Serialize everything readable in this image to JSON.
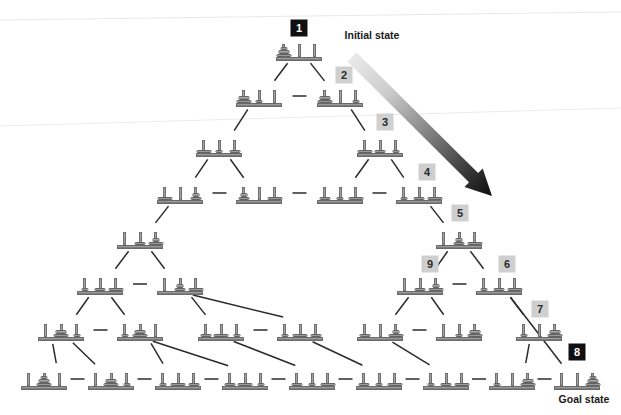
{
  "figure": {
    "type": "state-space-diagram"
  },
  "colors": {
    "tag_light_bg": "#cfcfcf",
    "tag_light_text": "#2a2a2a",
    "tag_dark_bg": "#101010",
    "tag_dark_text": "#ffffff",
    "disc": "#9a9a9a",
    "peg": "#8e8e8e",
    "base": "#8f8f8f",
    "edge": "#2b2b2b",
    "arrow_start": "#e2e2e2",
    "arrow_end": "#111111"
  },
  "captions": [
    {
      "id": "initial-state",
      "text": "Initial state",
      "x": 372,
      "y": 35
    },
    {
      "id": "goal-state",
      "text": "Goal state",
      "x": 584,
      "y": 399
    }
  ],
  "tags": [
    {
      "id": "1",
      "text": "1",
      "style": "dark",
      "x": 299,
      "y": 28
    },
    {
      "id": "2",
      "text": "2",
      "style": "light",
      "x": 344,
      "y": 75
    },
    {
      "id": "3",
      "text": "3",
      "style": "light",
      "x": 385,
      "y": 122
    },
    {
      "id": "4",
      "text": "4",
      "style": "light",
      "x": 427,
      "y": 172
    },
    {
      "id": "5",
      "text": "5",
      "style": "light",
      "x": 460,
      "y": 213
    },
    {
      "id": "9",
      "text": "9",
      "style": "light",
      "x": 430,
      "y": 264
    },
    {
      "id": "6",
      "text": "6",
      "style": "light",
      "x": 507,
      "y": 264
    },
    {
      "id": "7",
      "text": "7",
      "style": "light",
      "x": 540,
      "y": 309
    },
    {
      "id": "8",
      "text": "8",
      "style": "dark",
      "x": 577,
      "y": 352
    }
  ],
  "layout": {
    "rows_y": [
      50,
      96,
      146,
      193,
      238,
      284,
      330,
      379
    ],
    "node_width": 46,
    "node_height": 22,
    "peg_count": 3,
    "disc_count": 3
  },
  "nodes": [
    {
      "id": "n1",
      "row": 0,
      "x": 299,
      "y": 50,
      "pegs": [
        [
          3,
          2,
          1
        ],
        [],
        []
      ]
    },
    {
      "id": "n2",
      "row": 1,
      "x": 259,
      "y": 96,
      "pegs": [
        [
          3,
          2
        ],
        [
          1
        ],
        []
      ]
    },
    {
      "id": "n3",
      "row": 1,
      "x": 340,
      "y": 96,
      "pegs": [
        [
          3,
          2
        ],
        [],
        [
          1
        ]
      ]
    },
    {
      "id": "n4",
      "row": 2,
      "x": 219,
      "y": 146,
      "pegs": [
        [
          3
        ],
        [
          1
        ],
        [
          2
        ]
      ]
    },
    {
      "id": "n5",
      "row": 2,
      "x": 380,
      "y": 146,
      "pegs": [
        [
          3
        ],
        [
          2
        ],
        [
          1
        ]
      ]
    },
    {
      "id": "n6",
      "row": 3,
      "x": 180,
      "y": 193,
      "pegs": [
        [
          3
        ],
        [],
        [
          2,
          1
        ]
      ]
    },
    {
      "id": "n7",
      "row": 3,
      "x": 259,
      "y": 193,
      "pegs": [
        [
          2,
          1
        ],
        [],
        [
          3
        ]
      ]
    },
    {
      "id": "n8",
      "row": 3,
      "x": 340,
      "y": 193,
      "pegs": [
        [
          2
        ],
        [
          1
        ],
        [
          3
        ]
      ]
    },
    {
      "id": "n9",
      "row": 3,
      "x": 419,
      "y": 193,
      "pegs": [
        [
          1
        ],
        [
          2
        ],
        [
          3
        ]
      ]
    },
    {
      "id": "n10",
      "row": 4,
      "x": 140,
      "y": 238,
      "pegs": [
        [],
        [
          2
        ],
        [
          3,
          1
        ]
      ]
    },
    {
      "id": "n11",
      "row": 4,
      "x": 459,
      "y": 238,
      "pegs": [
        [],
        [
          2,
          1
        ],
        [
          3
        ]
      ]
    },
    {
      "id": "n12",
      "row": 5,
      "x": 100,
      "y": 284,
      "pegs": [
        [
          1
        ],
        [
          2
        ],
        [
          3
        ]
      ]
    },
    {
      "id": "n13",
      "row": 5,
      "x": 180,
      "y": 284,
      "pegs": [
        [],
        [
          2,
          1
        ],
        [
          3
        ]
      ]
    },
    {
      "id": "n14",
      "row": 5,
      "x": 420,
      "y": 284,
      "pegs": [
        [],
        [
          2
        ],
        [
          3,
          1
        ]
      ]
    },
    {
      "id": "n15",
      "row": 5,
      "x": 499,
      "y": 284,
      "pegs": [
        [
          1
        ],
        [
          2
        ],
        [
          3
        ]
      ]
    },
    {
      "id": "n16",
      "row": 6,
      "x": 61,
      "y": 330,
      "pegs": [
        [],
        [
          3,
          2
        ],
        [
          1
        ]
      ]
    },
    {
      "id": "n17",
      "row": 6,
      "x": 140,
      "y": 330,
      "pegs": [
        [
          1
        ],
        [
          3,
          2
        ],
        []
      ]
    },
    {
      "id": "n18",
      "row": 6,
      "x": 221,
      "y": 330,
      "pegs": [
        [
          2
        ],
        [
          3
        ],
        [
          1
        ]
      ]
    },
    {
      "id": "n19",
      "row": 6,
      "x": 300,
      "y": 330,
      "pegs": [
        [
          1
        ],
        [
          3
        ],
        [
          2
        ]
      ]
    },
    {
      "id": "n20",
      "row": 6,
      "x": 380,
      "y": 330,
      "pegs": [
        [
          2
        ],
        [],
        [
          3,
          1
        ]
      ]
    },
    {
      "id": "n21",
      "row": 6,
      "x": 459,
      "y": 330,
      "pegs": [
        [],
        [
          1
        ],
        [
          3,
          2
        ]
      ]
    },
    {
      "id": "n22",
      "row": 6,
      "x": 539,
      "y": 330,
      "pegs": [
        [
          1
        ],
        [],
        [
          3,
          2
        ]
      ]
    },
    {
      "id": "n23",
      "row": 7,
      "x": 44,
      "y": 379,
      "pegs": [
        [],
        [
          3,
          2,
          1
        ],
        []
      ]
    },
    {
      "id": "n24",
      "row": 7,
      "x": 111,
      "y": 379,
      "pegs": [
        [],
        [
          3,
          2
        ],
        [
          1
        ]
      ]
    },
    {
      "id": "n25",
      "row": 7,
      "x": 178,
      "y": 379,
      "pegs": [
        [
          1
        ],
        [
          3
        ],
        [
          2
        ]
      ]
    },
    {
      "id": "n26",
      "row": 7,
      "x": 245,
      "y": 379,
      "pegs": [
        [
          2
        ],
        [
          3
        ],
        [
          1
        ]
      ]
    },
    {
      "id": "n27",
      "row": 7,
      "x": 312,
      "y": 379,
      "pegs": [
        [
          2
        ],
        [
          1
        ],
        [
          3
        ]
      ]
    },
    {
      "id": "n28",
      "row": 7,
      "x": 379,
      "y": 379,
      "pegs": [
        [
          2
        ],
        [
          1
        ],
        [
          3
        ]
      ]
    },
    {
      "id": "n29",
      "row": 7,
      "x": 446,
      "y": 379,
      "pegs": [
        [
          1
        ],
        [
          2
        ],
        [
          3
        ]
      ]
    },
    {
      "id": "n30",
      "row": 7,
      "x": 577,
      "y": 379,
      "pegs": [
        [],
        [],
        [
          3,
          2,
          1
        ]
      ]
    },
    {
      "id": "n31",
      "row": 7,
      "x": 512,
      "y": 379,
      "pegs": [
        [
          1
        ],
        [],
        [
          3,
          2
        ]
      ]
    }
  ],
  "edges_diagonal": [
    [
      "n1",
      "n2"
    ],
    [
      "n1",
      "n3"
    ],
    [
      "n2",
      "n4"
    ],
    [
      "n3",
      "n5"
    ],
    [
      "n4",
      "n6"
    ],
    [
      "n4",
      "n7"
    ],
    [
      "n5",
      "n8"
    ],
    [
      "n5",
      "n9"
    ],
    [
      "n6",
      "n10"
    ],
    [
      "n9",
      "n11"
    ],
    [
      "n10",
      "n12"
    ],
    [
      "n10",
      "n13"
    ],
    [
      "n11",
      "n14"
    ],
    [
      "n11",
      "n15"
    ],
    [
      "n12",
      "n16"
    ],
    [
      "n12",
      "n17"
    ],
    [
      "n13",
      "n18"
    ],
    [
      "n13",
      "n19"
    ],
    [
      "n14",
      "n20"
    ],
    [
      "n14",
      "n21"
    ],
    [
      "n15",
      "n22"
    ],
    [
      "n15",
      "n30"
    ],
    [
      "n16",
      "n23"
    ],
    [
      "n16",
      "n24"
    ],
    [
      "n17",
      "n25"
    ],
    [
      "n17",
      "n26"
    ],
    [
      "n18",
      "n27"
    ],
    [
      "n19",
      "n28"
    ],
    [
      "n20",
      "n29"
    ],
    [
      "n22",
      "n31"
    ]
  ],
  "edges_horizontal": [
    [
      "n2",
      "n3"
    ],
    [
      "n6",
      "n7"
    ],
    [
      "n7",
      "n8"
    ],
    [
      "n8",
      "n9"
    ],
    [
      "n12",
      "n13"
    ],
    [
      "n14",
      "n15"
    ],
    [
      "n16",
      "n17"
    ],
    [
      "n18",
      "n19"
    ],
    [
      "n20",
      "n21"
    ],
    [
      "n23",
      "n24"
    ],
    [
      "n24",
      "n25"
    ],
    [
      "n25",
      "n26"
    ],
    [
      "n26",
      "n27"
    ],
    [
      "n27",
      "n28"
    ],
    [
      "n28",
      "n29"
    ],
    [
      "n29",
      "n31"
    ],
    [
      "n31",
      "n30"
    ]
  ],
  "arrow": {
    "id": "initial-to-goal-arrow",
    "x1": 352,
    "y1": 57,
    "x2": 492,
    "y2": 196,
    "width": 13
  }
}
